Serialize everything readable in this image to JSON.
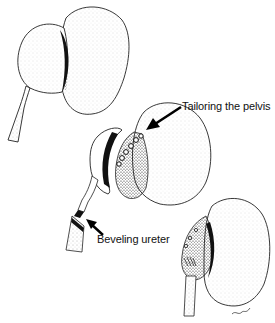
{
  "figure": {
    "panels": [
      {
        "name": "kidney-before",
        "description": "Kidney with dilated renal pelvis and narrowed ureter"
      },
      {
        "name": "kidney-during",
        "description": "Tailoring the pelvis and beveling the ureter"
      },
      {
        "name": "kidney-after",
        "description": "Reconstructed pelvis with anastomosed ureter"
      }
    ],
    "labels": {
      "pelvis": "Tailoring the pelvis",
      "ureter": "Beveling ureter"
    },
    "signature": "artist signature"
  },
  "colors": {
    "ink": "#111111",
    "stipple": "#333333",
    "background": "#ffffff"
  }
}
